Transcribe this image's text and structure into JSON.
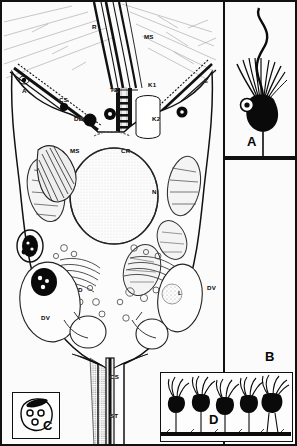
{
  "figure": {
    "border_color": "#111111",
    "background_color": "#fbfbfb",
    "ink_color": "#050505"
  },
  "panels": [
    {
      "id": "main",
      "label": "",
      "caption": "Longitudinal section through a choanocyte"
    },
    {
      "id": "a",
      "label": "A",
      "caption": "Whole choanoflagellate cell with flagellum and collar"
    },
    {
      "id": "b",
      "label": "B",
      "caption": "Field region"
    },
    {
      "id": "c",
      "label": "C",
      "caption": "Transverse section inset"
    },
    {
      "id": "d",
      "label": "D",
      "caption": "Row of attached collar cells on substrate"
    }
  ],
  "panel_labels": {
    "a": "A",
    "b": "B",
    "c": "C",
    "d": "D"
  },
  "structure_labels": [
    {
      "text": "R",
      "x": 90,
      "y": 22,
      "name": "label-r"
    },
    {
      "text": "MS",
      "x": 142,
      "y": 32,
      "name": "label-ms-top"
    },
    {
      "text": "A",
      "x": 20,
      "y": 86,
      "name": "label-a-left"
    },
    {
      "text": "CS",
      "x": 57,
      "y": 95,
      "name": "label-cs-upper"
    },
    {
      "text": "TZ",
      "x": 108,
      "y": 85,
      "name": "label-tz"
    },
    {
      "text": "K1",
      "x": 146,
      "y": 80,
      "name": "label-k1"
    },
    {
      "text": "E",
      "x": 202,
      "y": 76,
      "name": "label-e"
    },
    {
      "text": "DB",
      "x": 72,
      "y": 114,
      "name": "label-db"
    },
    {
      "text": "K2",
      "x": 150,
      "y": 114,
      "name": "label-k2"
    },
    {
      "text": "MS",
      "x": 68,
      "y": 146,
      "name": "label-ms-left"
    },
    {
      "text": "CR",
      "x": 119,
      "y": 146,
      "name": "label-cr"
    },
    {
      "text": "N",
      "x": 150,
      "y": 187,
      "name": "label-n"
    },
    {
      "text": "D",
      "x": 76,
      "y": 285,
      "name": "label-d-small"
    },
    {
      "text": "L",
      "x": 176,
      "y": 288,
      "name": "label-l"
    },
    {
      "text": "DV",
      "x": 205,
      "y": 283,
      "name": "label-dv-right"
    },
    {
      "text": "DV",
      "x": 39,
      "y": 313,
      "name": "label-dv-left"
    },
    {
      "text": "CS",
      "x": 108,
      "y": 372,
      "name": "label-cs-lower"
    },
    {
      "text": "ST",
      "x": 108,
      "y": 411,
      "name": "label-st"
    }
  ],
  "legend_keys": {
    "R": "rootlet",
    "MS": "microvilli / striated structure",
    "A": "apical region",
    "CS": "collar / cytoplasmic strand",
    "TZ": "transition zone",
    "K1": "kinetosome 1",
    "K2": "kinetosome 2",
    "E": "ectoplasm",
    "DB": "dense body",
    "CR": "cytoplasmic ridge",
    "N": "nucleus",
    "D": "dictyosome / Golgi",
    "L": "lipid droplet",
    "DV": "digestive vacuole",
    "ST": "stalk"
  },
  "panel_d": {
    "cell_count": 5,
    "substrate": "black basal line"
  },
  "panel_c": {
    "vesicle_count": 3,
    "has_dark_cap": true
  }
}
